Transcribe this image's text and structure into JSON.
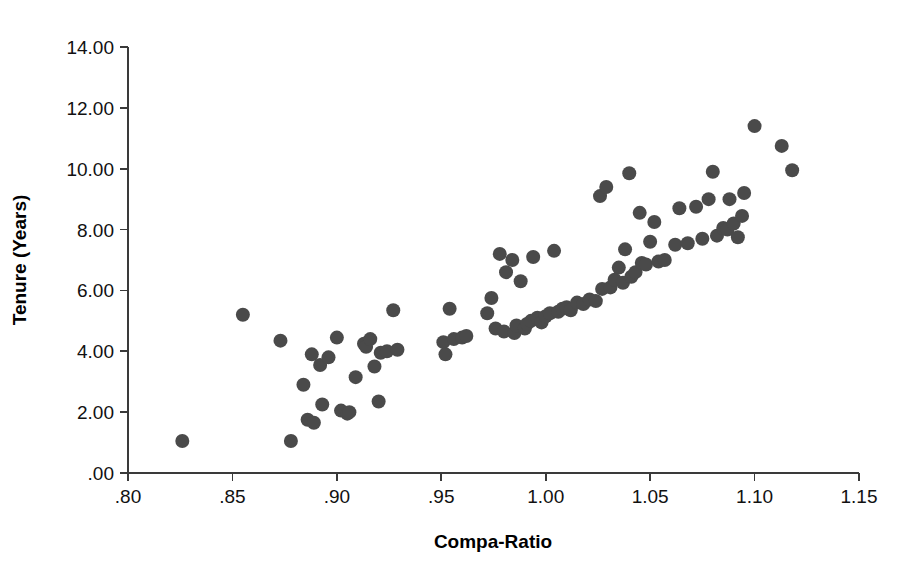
{
  "chart_data": {
    "type": "scatter",
    "title": "",
    "xlabel": "Compa-Ratio",
    "ylabel": "Tenure (Years)",
    "xlim": [
      0.8,
      1.15
    ],
    "ylim": [
      0.0,
      14.0
    ],
    "xticks": [
      0.8,
      0.85,
      0.9,
      0.95,
      1.0,
      1.05,
      1.1,
      1.15
    ],
    "xtick_labels": [
      ".80",
      ".85",
      ".90",
      ".95",
      "1.00",
      "1.05",
      "1.10",
      "1.15"
    ],
    "yticks": [
      0,
      2,
      4,
      6,
      8,
      10,
      12,
      14
    ],
    "ytick_labels": [
      ".00",
      "2.00",
      "4.00",
      "6.00",
      "8.00",
      "10.00",
      "12.00",
      "14.00"
    ],
    "grid": false,
    "legend": null,
    "marker": {
      "shape": "circle",
      "color": "#4a4a4a",
      "radius_px": 7
    },
    "series": [
      {
        "name": "Employees",
        "points": [
          [
            0.826,
            1.05
          ],
          [
            0.855,
            5.2
          ],
          [
            0.873,
            4.35
          ],
          [
            0.878,
            1.05
          ],
          [
            0.884,
            2.9
          ],
          [
            0.886,
            1.75
          ],
          [
            0.888,
            3.9
          ],
          [
            0.889,
            1.65
          ],
          [
            0.892,
            3.55
          ],
          [
            0.893,
            2.25
          ],
          [
            0.896,
            3.8
          ],
          [
            0.9,
            4.45
          ],
          [
            0.902,
            2.05
          ],
          [
            0.905,
            1.95
          ],
          [
            0.906,
            2.0
          ],
          [
            0.909,
            3.15
          ],
          [
            0.913,
            4.25
          ],
          [
            0.914,
            4.15
          ],
          [
            0.916,
            4.4
          ],
          [
            0.918,
            3.5
          ],
          [
            0.92,
            2.35
          ],
          [
            0.921,
            3.95
          ],
          [
            0.924,
            4.0
          ],
          [
            0.927,
            5.35
          ],
          [
            0.929,
            4.05
          ],
          [
            0.951,
            4.3
          ],
          [
            0.952,
            3.9
          ],
          [
            0.954,
            5.4
          ],
          [
            0.956,
            4.4
          ],
          [
            0.96,
            4.45
          ],
          [
            0.962,
            4.5
          ],
          [
            0.972,
            5.25
          ],
          [
            0.974,
            5.75
          ],
          [
            0.976,
            4.75
          ],
          [
            0.978,
            7.2
          ],
          [
            0.98,
            4.65
          ],
          [
            0.981,
            6.6
          ],
          [
            0.984,
            7.0
          ],
          [
            0.985,
            4.6
          ],
          [
            0.986,
            4.85
          ],
          [
            0.988,
            6.3
          ],
          [
            0.99,
            4.75
          ],
          [
            0.991,
            4.9
          ],
          [
            0.993,
            5.0
          ],
          [
            0.994,
            7.1
          ],
          [
            0.996,
            5.1
          ],
          [
            0.998,
            4.95
          ],
          [
            1.0,
            5.15
          ],
          [
            1.002,
            5.25
          ],
          [
            1.004,
            7.3
          ],
          [
            1.006,
            5.3
          ],
          [
            1.008,
            5.4
          ],
          [
            1.01,
            5.45
          ],
          [
            1.012,
            5.35
          ],
          [
            1.015,
            5.6
          ],
          [
            1.018,
            5.55
          ],
          [
            1.021,
            5.7
          ],
          [
            1.024,
            5.65
          ],
          [
            1.026,
            9.1
          ],
          [
            1.027,
            6.05
          ],
          [
            1.029,
            9.4
          ],
          [
            1.031,
            6.1
          ],
          [
            1.033,
            6.35
          ],
          [
            1.035,
            6.75
          ],
          [
            1.037,
            6.25
          ],
          [
            1.038,
            7.35
          ],
          [
            1.04,
            9.85
          ],
          [
            1.041,
            6.45
          ],
          [
            1.043,
            6.6
          ],
          [
            1.045,
            8.55
          ],
          [
            1.046,
            6.9
          ],
          [
            1.048,
            6.85
          ],
          [
            1.05,
            7.6
          ],
          [
            1.052,
            8.25
          ],
          [
            1.054,
            6.95
          ],
          [
            1.057,
            7.0
          ],
          [
            1.062,
            7.5
          ],
          [
            1.064,
            8.7
          ],
          [
            1.068,
            7.55
          ],
          [
            1.072,
            8.75
          ],
          [
            1.075,
            7.7
          ],
          [
            1.078,
            9.0
          ],
          [
            1.08,
            9.9
          ],
          [
            1.082,
            7.8
          ],
          [
            1.085,
            8.05
          ],
          [
            1.087,
            8.0
          ],
          [
            1.088,
            9.0
          ],
          [
            1.09,
            8.2
          ],
          [
            1.092,
            7.75
          ],
          [
            1.094,
            8.45
          ],
          [
            1.095,
            9.2
          ],
          [
            1.1,
            11.4
          ],
          [
            1.113,
            10.75
          ],
          [
            1.118,
            9.95
          ]
        ]
      }
    ]
  },
  "plot_geometry": {
    "left_px": 128,
    "right_px": 859,
    "top_px": 47,
    "bottom_px": 473
  }
}
